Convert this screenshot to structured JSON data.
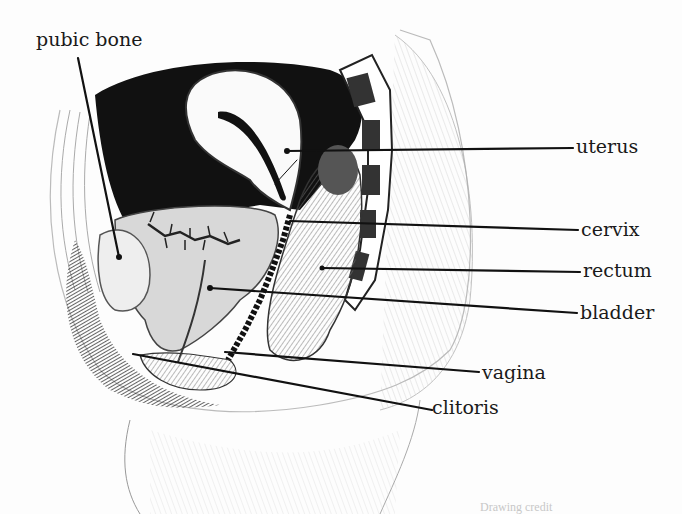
{
  "figure": {
    "type": "anatomical-illustration"
  },
  "labels": [
    {
      "id": "pubic-bone",
      "text": "pubic bone",
      "x": 36,
      "y": 30,
      "anchor": [
        119,
        257
      ],
      "line_start": [
        78,
        58
      ]
    },
    {
      "id": "uterus",
      "text": "uterus",
      "x": 576,
      "y": 137,
      "anchor": [
        287,
        151
      ],
      "line_start": [
        573,
        147
      ]
    },
    {
      "id": "cervix",
      "text": "cervix",
      "x": 581,
      "y": 220,
      "anchor": [
        290,
        221
      ],
      "line_start": [
        578,
        230
      ]
    },
    {
      "id": "rectum",
      "text": "rectum",
      "x": 583,
      "y": 261,
      "anchor": [
        322,
        268
      ],
      "line_start": [
        580,
        272
      ]
    },
    {
      "id": "bladder",
      "text": "bladder",
      "x": 580,
      "y": 303,
      "anchor": [
        210,
        288
      ],
      "line_start": [
        577,
        313
      ]
    },
    {
      "id": "vagina",
      "text": "vagina",
      "x": 482,
      "y": 363,
      "anchor": [
        225,
        352
      ],
      "line_start": [
        479,
        372
      ]
    },
    {
      "id": "clitoris",
      "text": "clitoris",
      "x": 432,
      "y": 398,
      "anchor": [
        133,
        354
      ],
      "line_start": [
        432,
        410
      ]
    }
  ],
  "credit": {
    "text": "Drawing credit"
  }
}
